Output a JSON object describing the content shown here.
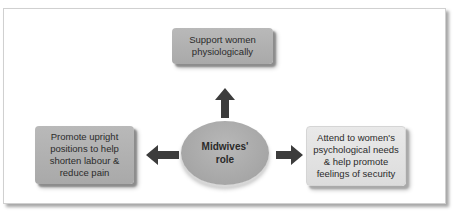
{
  "figure": {
    "caption_fragment": "Figure"
  },
  "diagram": {
    "center": {
      "label": "Midwives'\nrole"
    },
    "nodes": [
      {
        "id": "top",
        "label": "Support women\nphysiologically",
        "direction": "up"
      },
      {
        "id": "left",
        "label": "Promote upright\npositions to help\nshorten labour &\nreduce pain",
        "direction": "left"
      },
      {
        "id": "right",
        "label": "Attend to women's\npsychological needs\n& help promote\nfeelings of security",
        "direction": "right"
      }
    ],
    "colors": {
      "box_dark": "#afafaf",
      "box_light": "#e2e2e2",
      "arrow": "#3c3c3c",
      "text": "#2b2b2b"
    }
  }
}
